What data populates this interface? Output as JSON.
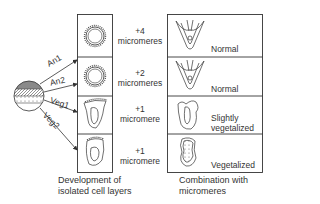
{
  "sphere_layers": [
    "An1",
    "An2",
    "Veg1",
    "Veg2"
  ],
  "left_column": {
    "caption_line1": "Development of",
    "caption_line2": "isolated cell layers"
  },
  "middle_labels": [
    {
      "count": "+4",
      "unit": "micromeres"
    },
    {
      "count": "+2",
      "unit": "micromeres"
    },
    {
      "count": "+1",
      "unit": "micromere"
    },
    {
      "count": "+1",
      "unit": "micromere"
    }
  ],
  "right_column": {
    "outcomes": [
      {
        "line1": "Normal",
        "line2": ""
      },
      {
        "line1": "Normal",
        "line2": ""
      },
      {
        "line1": "Slightly",
        "line2": "vegetalized"
      },
      {
        "line1": "Vegetalized",
        "line2": ""
      }
    ],
    "caption_line1": "Combination with",
    "caption_line2": "micromeres"
  },
  "colors": {
    "line": "#333333",
    "shade": "#8a8a8a"
  }
}
